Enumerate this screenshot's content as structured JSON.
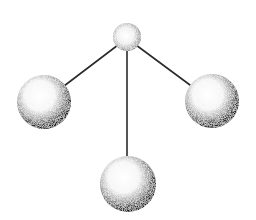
{
  "diagram": {
    "type": "ball-and-stick-molecule",
    "background": "#ffffff",
    "bond_color": "#2a2a2a",
    "atoms": [
      {
        "id": "central",
        "role": "central-atom",
        "cx": 127,
        "cy": 37,
        "r": 14
      },
      {
        "id": "left",
        "role": "outer-atom",
        "cx": 44,
        "cy": 102,
        "r": 27
      },
      {
        "id": "right",
        "role": "outer-atom",
        "cx": 212,
        "cy": 101,
        "r": 27
      },
      {
        "id": "bottom",
        "role": "outer-atom",
        "cx": 128,
        "cy": 184,
        "r": 28
      }
    ],
    "bonds": [
      {
        "from": "central",
        "to": "left",
        "x1": 118,
        "y1": 45,
        "x2": 64,
        "y2": 86
      },
      {
        "from": "central",
        "to": "bottom",
        "x1": 127,
        "y1": 48,
        "x2": 127,
        "y2": 157
      },
      {
        "from": "central",
        "to": "right",
        "x1": 136,
        "y1": 45,
        "x2": 190,
        "y2": 85
      }
    ]
  }
}
